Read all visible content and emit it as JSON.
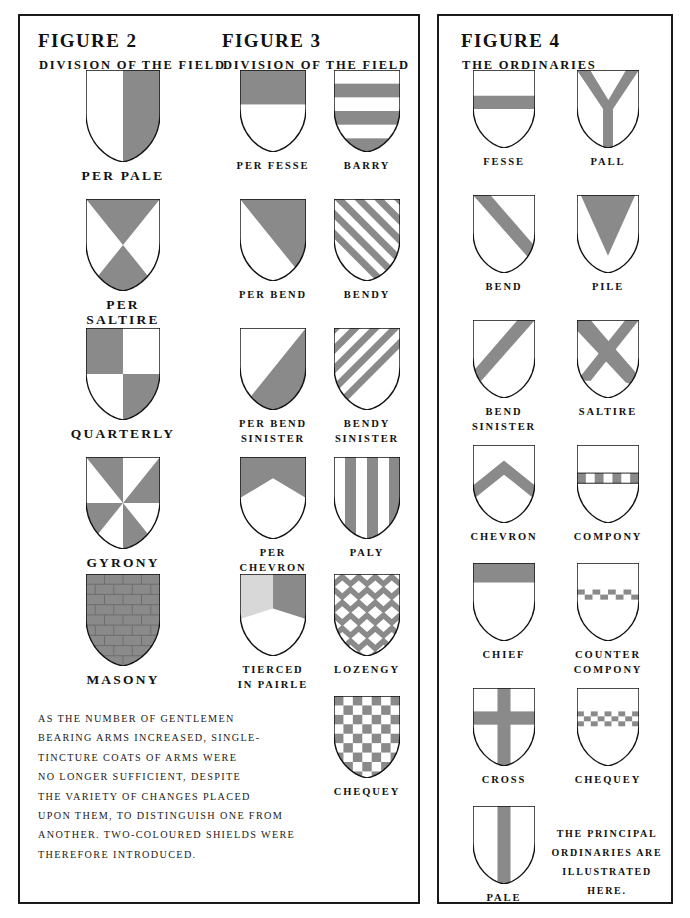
{
  "page": {
    "background": "#ffffff",
    "ink": "#111111",
    "tincture_gray": "#8a8a8a",
    "tincture_light": "#d8d8d8",
    "tincture_white": "#ffffff"
  },
  "panels": [
    {
      "id": "left",
      "name": "figures-2-and-3-panel"
    },
    {
      "id": "right",
      "name": "figure-4-panel"
    }
  ],
  "figure2": {
    "title": "FIGURE 2",
    "subtitle": "DIVISION OF THE FIELD",
    "shields": [
      {
        "label": "PER PALE",
        "pattern": "per-pale"
      },
      {
        "label": "PER SALTIRE",
        "pattern": "per-saltire"
      },
      {
        "label": "QUARTERLY",
        "pattern": "quarterly"
      },
      {
        "label": "GYRONY",
        "pattern": "gyrony"
      },
      {
        "label": "MASONY",
        "pattern": "masony"
      }
    ],
    "body_text": "AS THE NUMBER OF GENTLEMEN\nBEARING ARMS INCREASED, SINGLE-\nTINCTURE COATS OF ARMS WERE\nNO LONGER SUFFICIENT, DESPITE\nTHE VARIETY OF CHANGES PLACED\nUPON THEM, TO DISTINGUISH ONE FROM\nANOTHER. TWO-COLOURED SHIELDS WERE\nTHEREFORE INTRODUCED."
  },
  "figure3": {
    "title": "FIGURE 3",
    "subtitle": "DIVISION OF THE FIELD",
    "shields_left": [
      {
        "label": "PER FESSE",
        "pattern": "per-fesse"
      },
      {
        "label": "PER BEND",
        "pattern": "per-bend"
      },
      {
        "label": "PER BEND\nSINISTER",
        "pattern": "per-bend-sinister"
      },
      {
        "label": "PER\nCHEVRON",
        "pattern": "per-chevron"
      },
      {
        "label": "TIERCED\nIN PAIRLE",
        "pattern": "tierced-in-pairle"
      }
    ],
    "shields_right": [
      {
        "label": "BARRY",
        "pattern": "barry"
      },
      {
        "label": "BENDY",
        "pattern": "bendy"
      },
      {
        "label": "BENDY\nSINISTER",
        "pattern": "bendy-sinister"
      },
      {
        "label": "PALY",
        "pattern": "paly"
      },
      {
        "label": "LOZENGY",
        "pattern": "lozengy"
      },
      {
        "label": "CHEQUEY",
        "pattern": "chequey"
      }
    ]
  },
  "figure4": {
    "title": "FIGURE 4",
    "subtitle": "THE ORDINARIES",
    "shields_left": [
      {
        "label": "FESSE",
        "pattern": "fesse"
      },
      {
        "label": "BEND",
        "pattern": "bend"
      },
      {
        "label": "BEND\nSINISTER",
        "pattern": "bend-sinister"
      },
      {
        "label": "CHEVRON",
        "pattern": "chevron"
      },
      {
        "label": "CHIEF",
        "pattern": "chief"
      },
      {
        "label": "CROSS",
        "pattern": "cross"
      },
      {
        "label": "PALE",
        "pattern": "pale"
      }
    ],
    "shields_right": [
      {
        "label": "PALL",
        "pattern": "pall"
      },
      {
        "label": "PILE",
        "pattern": "pile"
      },
      {
        "label": "SALTIRE",
        "pattern": "saltire"
      },
      {
        "label": "COMPONY",
        "pattern": "compony"
      },
      {
        "label": "COUNTER\nCOMPONY",
        "pattern": "counter-compony"
      },
      {
        "label": "CHEQUEY",
        "pattern": "chequey-band"
      }
    ],
    "note_text": "THE PRINCIPAL\nORDINARIES ARE\nILLUSTRATED HERE."
  }
}
